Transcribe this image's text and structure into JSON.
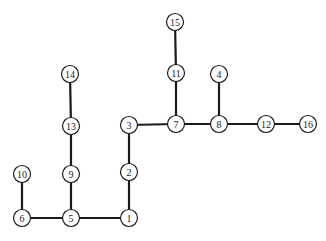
{
  "diagram": {
    "type": "tree",
    "nodes": [
      {
        "id": "1",
        "label": "1",
        "x": 129,
        "y": 218
      },
      {
        "id": "2",
        "label": "2",
        "x": 129,
        "y": 172
      },
      {
        "id": "3",
        "label": "3",
        "x": 129,
        "y": 125
      },
      {
        "id": "4",
        "label": "4",
        "x": 219,
        "y": 74
      },
      {
        "id": "5",
        "label": "5",
        "x": 71,
        "y": 218
      },
      {
        "id": "6",
        "label": "6",
        "x": 22,
        "y": 218
      },
      {
        "id": "7",
        "label": "7",
        "x": 176,
        "y": 124
      },
      {
        "id": "8",
        "label": "8",
        "x": 219,
        "y": 124
      },
      {
        "id": "9",
        "label": "9",
        "x": 71,
        "y": 174
      },
      {
        "id": "10",
        "label": "10",
        "x": 22,
        "y": 174
      },
      {
        "id": "11",
        "label": "11",
        "x": 176,
        "y": 73
      },
      {
        "id": "12",
        "label": "12",
        "x": 266,
        "y": 124
      },
      {
        "id": "13",
        "label": "13",
        "x": 71,
        "y": 126
      },
      {
        "id": "14",
        "label": "14",
        "x": 70,
        "y": 74
      },
      {
        "id": "15",
        "label": "15",
        "x": 175,
        "y": 22
      },
      {
        "id": "16",
        "label": "16",
        "x": 308,
        "y": 124
      }
    ],
    "edges": [
      [
        "1",
        "5"
      ],
      [
        "5",
        "6"
      ],
      [
        "6",
        "10"
      ],
      [
        "5",
        "9"
      ],
      [
        "9",
        "13"
      ],
      [
        "13",
        "14"
      ],
      [
        "1",
        "2"
      ],
      [
        "2",
        "3"
      ],
      [
        "3",
        "7"
      ],
      [
        "7",
        "11"
      ],
      [
        "11",
        "15"
      ],
      [
        "7",
        "8"
      ],
      [
        "8",
        "4"
      ],
      [
        "8",
        "12"
      ],
      [
        "12",
        "16"
      ]
    ]
  }
}
